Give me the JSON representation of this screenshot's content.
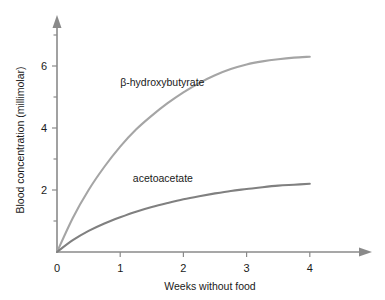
{
  "chart_data": {
    "type": "line",
    "title": "",
    "xlabel": "Weeks without food",
    "ylabel": "Blood concentration (millimolar)",
    "xlim": [
      0,
      4.5
    ],
    "ylim": [
      0,
      7.1
    ],
    "xticks": [
      0,
      1,
      2,
      3,
      4
    ],
    "xtick_labels": [
      "0",
      "1",
      "2",
      "3",
      "4"
    ],
    "yticks": [
      2,
      4,
      6
    ],
    "ytick_labels": [
      "2",
      "4",
      "6"
    ],
    "yminorticks": [
      1,
      3,
      5,
      7
    ],
    "grid": false,
    "legend": "inline-labels",
    "x": [
      0,
      0.25,
      0.5,
      0.75,
      1,
      1.25,
      1.5,
      1.75,
      2,
      2.25,
      2.5,
      2.75,
      3,
      3.25,
      3.5,
      3.75,
      4
    ],
    "series": [
      {
        "name": "β-hydroxybutyrate",
        "color": "#a5a5a5",
        "values": [
          0,
          1.1,
          2.0,
          2.75,
          3.4,
          3.95,
          4.4,
          4.8,
          5.15,
          5.45,
          5.7,
          5.9,
          6.05,
          6.15,
          6.22,
          6.27,
          6.3
        ],
        "label_x": 1.0,
        "label_y": 5.35
      },
      {
        "name": "acetoacetate",
        "color": "#808080",
        "values": [
          0,
          0.38,
          0.68,
          0.92,
          1.12,
          1.3,
          1.45,
          1.58,
          1.7,
          1.8,
          1.89,
          1.97,
          2.03,
          2.09,
          2.14,
          2.17,
          2.2
        ],
        "label_x": 1.2,
        "label_y": 2.25
      }
    ],
    "axis_color": "#8a8a8a",
    "background": "#ffffff"
  }
}
